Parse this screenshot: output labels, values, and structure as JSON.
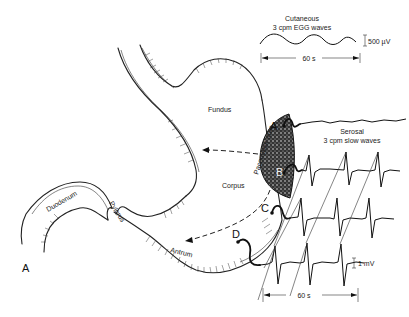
{
  "figure": {
    "panel_label": "A",
    "colors": {
      "ink": "#111111",
      "background": "#ffffff"
    },
    "cutaneous": {
      "title_line1": "Cutaneous",
      "title_line2": "3 cpm EGG waves",
      "scale_label": "500 µV",
      "time_label": "60 s"
    },
    "serosal": {
      "title_line1": "Serosal",
      "title_line2": "3 cpm slow waves",
      "scale_label": "1 mV",
      "time_label": "60 s"
    },
    "regions": {
      "fundus": "Fundus",
      "corpus": "Corpus",
      "antrum": "Antrum",
      "pylorus": "Pylorus",
      "duodenum": "Duodenum",
      "pacemaker": "Pacemaker area"
    },
    "electrodes": [
      "A",
      "B",
      "C",
      "D"
    ]
  }
}
